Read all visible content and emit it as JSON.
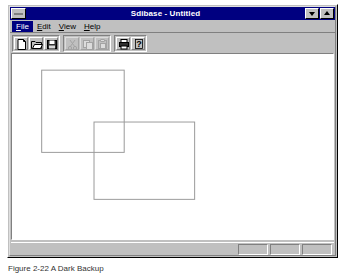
{
  "window": {
    "title": "Sdibase - Untitled",
    "system_menu_icon": "system-menu-icon",
    "minimize_label": "minimize",
    "maximize_label": "maximize"
  },
  "menu": {
    "items": [
      {
        "label": "File",
        "mnemonic": "F",
        "selected": true
      },
      {
        "label": "Edit",
        "mnemonic": "E",
        "selected": false
      },
      {
        "label": "View",
        "mnemonic": "V",
        "selected": false
      },
      {
        "label": "Help",
        "mnemonic": "H",
        "selected": false
      }
    ]
  },
  "toolbar": {
    "groups": [
      {
        "buttons": [
          {
            "name": "new-icon",
            "label": "New",
            "enabled": true
          },
          {
            "name": "open-folder-icon",
            "label": "Open",
            "enabled": true
          },
          {
            "name": "save-floppy-icon",
            "label": "Save",
            "enabled": true
          }
        ]
      },
      {
        "buttons": [
          {
            "name": "cut-scissors-icon",
            "label": "Cut",
            "enabled": false
          },
          {
            "name": "copy-icon",
            "label": "Copy",
            "enabled": false
          },
          {
            "name": "paste-clipboard-icon",
            "label": "Paste",
            "enabled": false
          }
        ]
      },
      {
        "buttons": [
          {
            "name": "print-icon",
            "label": "Print",
            "enabled": true
          },
          {
            "name": "help-question-icon",
            "label": "Help",
            "enabled": true
          }
        ]
      }
    ]
  },
  "canvas": {
    "background": "#ffffff",
    "stroke_color": "#9a9a9a",
    "stroke_width": 1,
    "shapes": [
      {
        "name": "rectangle-1",
        "type": "rectangle",
        "x": 29,
        "y": 16,
        "width": 82,
        "height": 84
      },
      {
        "name": "rectangle-2",
        "type": "rectangle",
        "x": 81,
        "y": 69,
        "width": 100,
        "height": 79
      }
    ]
  },
  "status_bar": {
    "message": "",
    "panes": [
      {
        "name": "status-pane-1",
        "text": ""
      },
      {
        "name": "status-pane-2",
        "text": ""
      },
      {
        "name": "status-pane-3",
        "text": ""
      }
    ]
  },
  "figure": {
    "caption": "Figure 2-22  A Dark Backup"
  }
}
